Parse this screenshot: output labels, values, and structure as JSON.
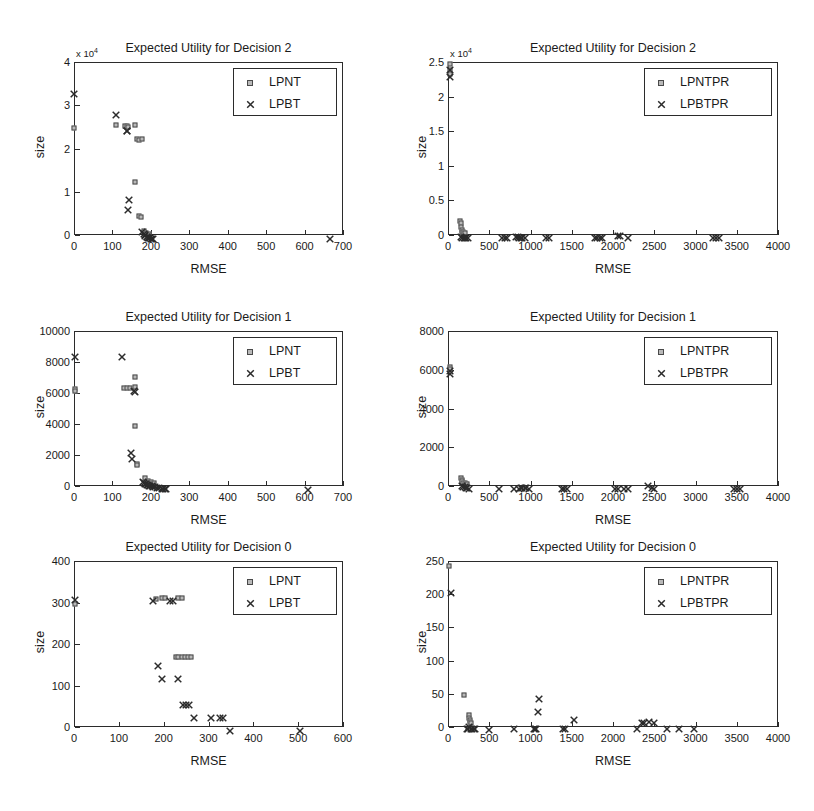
{
  "figure": {
    "width": 814,
    "height": 811,
    "background": "#ffffff",
    "ink_color": "#1a1a1a",
    "marker_square_fill": "#b9b9b9",
    "marker_square_edge": "#4a4a4a",
    "marker_x_color": "#2b2b2b"
  },
  "chart_data": [
    {
      "id": "panel-top-left",
      "type": "scatter",
      "title": "Expected Utility for Decision 2",
      "xlabel": "RMSE",
      "ylabel": "size",
      "xlim": [
        0,
        700
      ],
      "ylim": [
        0,
        40000
      ],
      "xticks": [
        0,
        100,
        200,
        300,
        400,
        500,
        600,
        700
      ],
      "yticks": [
        0,
        10000,
        20000,
        30000,
        40000
      ],
      "ytick_labels": [
        "0",
        "1",
        "2",
        "3",
        "4"
      ],
      "y_exponent_label": "x 10",
      "y_exponent_power": "4",
      "grid": false,
      "legend_position": "upper right",
      "series": [
        {
          "name": "LPNT",
          "marker": "square",
          "points": [
            [
              0,
              24800
            ],
            [
              108,
              25500
            ],
            [
              132,
              25300
            ],
            [
              138,
              25200
            ],
            [
              141,
              25000
            ],
            [
              160,
              25400
            ],
            [
              163,
              22100
            ],
            [
              170,
              22000
            ],
            [
              176,
              22100
            ],
            [
              158,
              12200
            ],
            [
              170,
              4300
            ],
            [
              175,
              4200
            ],
            [
              182,
              900
            ],
            [
              188,
              500
            ],
            [
              195,
              300
            ]
          ]
        },
        {
          "name": "LPBT",
          "marker": "x",
          "points": [
            [
              0,
              33700
            ],
            [
              110,
              28900
            ],
            [
              137,
              25300
            ],
            [
              139,
              25100
            ],
            [
              143,
              9200
            ],
            [
              140,
              6900
            ],
            [
              178,
              1800
            ],
            [
              181,
              1400
            ],
            [
              184,
              1100
            ],
            [
              186,
              900
            ],
            [
              189,
              700
            ],
            [
              191,
              600
            ],
            [
              193,
              500
            ],
            [
              195,
              400
            ],
            [
              198,
              350
            ],
            [
              200,
              300
            ],
            [
              203,
              250
            ],
            [
              206,
              200
            ],
            [
              665,
              120
            ]
          ]
        }
      ]
    },
    {
      "id": "panel-top-right",
      "type": "scatter",
      "title": "Expected Utility for Decision 2",
      "xlabel": "RMSE",
      "ylabel": "size",
      "xlim": [
        0,
        4000
      ],
      "ylim": [
        0,
        25000
      ],
      "xticks": [
        0,
        500,
        1000,
        1500,
        2000,
        2500,
        3000,
        3500,
        4000
      ],
      "yticks": [
        0,
        5000,
        10000,
        15000,
        20000,
        25000
      ],
      "ytick_labels": [
        "0",
        "0.5",
        "1",
        "1.5",
        "2",
        "2.5"
      ],
      "y_exponent_label": "x 10",
      "y_exponent_power": "4",
      "grid": false,
      "legend_position": "upper right",
      "series": [
        {
          "name": "LPNTPR",
          "marker": "square",
          "points": [
            [
              20,
              24700
            ],
            [
              25,
              23800
            ],
            [
              30,
              23300
            ],
            [
              150,
              2000
            ],
            [
              155,
              1700
            ],
            [
              160,
              1100
            ],
            [
              165,
              700
            ],
            [
              170,
              500
            ],
            [
              180,
              400
            ],
            [
              190,
              300
            ],
            [
              200,
              250
            ]
          ]
        },
        {
          "name": "LPBTPR",
          "marker": "x",
          "points": [
            [
              20,
              24600
            ],
            [
              28,
              23600
            ],
            [
              160,
              400
            ],
            [
              175,
              350
            ],
            [
              190,
              320
            ],
            [
              205,
              300
            ],
            [
              220,
              280
            ],
            [
              240,
              260
            ],
            [
              660,
              250
            ],
            [
              690,
              250
            ],
            [
              710,
              250
            ],
            [
              830,
              400
            ],
            [
              845,
              380
            ],
            [
              860,
              300
            ],
            [
              880,
              260
            ],
            [
              900,
              250
            ],
            [
              930,
              250
            ],
            [
              1190,
              260
            ],
            [
              1220,
              260
            ],
            [
              1780,
              260
            ],
            [
              1810,
              260
            ],
            [
              1840,
              260
            ],
            [
              1870,
              260
            ],
            [
              2060,
              600
            ],
            [
              2080,
              560
            ],
            [
              2180,
              250
            ],
            [
              3210,
              250
            ],
            [
              3250,
              250
            ],
            [
              3280,
              250
            ]
          ]
        }
      ]
    },
    {
      "id": "panel-mid-left",
      "type": "scatter",
      "title": "Expected Utility for Decision 1",
      "xlabel": "RMSE",
      "ylabel": "size",
      "xlim": [
        0,
        700
      ],
      "ylim": [
        0,
        10000
      ],
      "xticks": [
        0,
        100,
        200,
        300,
        400,
        500,
        600,
        700
      ],
      "yticks": [
        0,
        2000,
        4000,
        6000,
        8000,
        10000
      ],
      "ytick_labels": [
        "0",
        "2000",
        "4000",
        "6000",
        "8000",
        "10000"
      ],
      "grid": false,
      "legend_position": "upper right",
      "series": [
        {
          "name": "LPNT",
          "marker": "square",
          "points": [
            [
              2,
              6250
            ],
            [
              2,
              6150
            ],
            [
              131,
              6350
            ],
            [
              139,
              6330
            ],
            [
              145,
              6330
            ],
            [
              158,
              7050
            ],
            [
              160,
              6400
            ],
            [
              160,
              3880
            ],
            [
              163,
              1400
            ],
            [
              165,
              1330
            ],
            [
              185,
              500
            ],
            [
              193,
              350
            ],
            [
              200,
              250
            ],
            [
              208,
              180
            ]
          ]
        },
        {
          "name": "LPBT",
          "marker": "x",
          "points": [
            [
              2,
              8650
            ],
            [
              124,
              8640
            ],
            [
              155,
              6420
            ],
            [
              160,
              6400
            ],
            [
              149,
              2450
            ],
            [
              150,
              2050
            ],
            [
              180,
              600
            ],
            [
              183,
              520
            ],
            [
              186,
              470
            ],
            [
              188,
              430
            ],
            [
              190,
              400
            ],
            [
              193,
              380
            ],
            [
              196,
              350
            ],
            [
              199,
              330
            ],
            [
              202,
              300
            ],
            [
              205,
              280
            ],
            [
              210,
              250
            ],
            [
              215,
              220
            ],
            [
              222,
              190
            ],
            [
              228,
              160
            ],
            [
              232,
              140
            ],
            [
              236,
              120
            ],
            [
              240,
              100
            ],
            [
              610,
              60
            ]
          ]
        }
      ]
    },
    {
      "id": "panel-mid-right",
      "type": "scatter",
      "title": "Expected Utility for Decision 1",
      "xlabel": "RMSE",
      "ylabel": "size",
      "xlim": [
        0,
        4000
      ],
      "ylim": [
        0,
        8000
      ],
      "xticks": [
        0,
        500,
        1000,
        1500,
        2000,
        2500,
        3000,
        3500,
        4000
      ],
      "yticks": [
        0,
        2000,
        4000,
        6000,
        8000
      ],
      "ytick_labels": [
        "0",
        "2000",
        "4000",
        "6000",
        "8000"
      ],
      "grid": false,
      "legend_position": "upper right",
      "series": [
        {
          "name": "LPNTPR",
          "marker": "square",
          "points": [
            [
              20,
              6150
            ],
            [
              25,
              6050
            ],
            [
              155,
              420
            ],
            [
              165,
              330
            ],
            [
              175,
              240
            ],
            [
              185,
              180
            ],
            [
              200,
              140
            ],
            [
              215,
              110
            ],
            [
              230,
              90
            ]
          ]
        },
        {
          "name": "LPBTPR",
          "marker": "x",
          "points": [
            [
              20,
              6180
            ],
            [
              25,
              6020
            ],
            [
              170,
              260
            ],
            [
              185,
              230
            ],
            [
              200,
              200
            ],
            [
              215,
              180
            ],
            [
              235,
              150
            ],
            [
              260,
              120
            ],
            [
              620,
              90
            ],
            [
              800,
              110
            ],
            [
              860,
              100
            ],
            [
              880,
              130
            ],
            [
              900,
              150
            ],
            [
              930,
              160
            ],
            [
              950,
              130
            ],
            [
              980,
              110
            ],
            [
              1380,
              100
            ],
            [
              1410,
              100
            ],
            [
              1440,
              100
            ],
            [
              2030,
              110
            ],
            [
              2060,
              110
            ],
            [
              2130,
              110
            ],
            [
              2180,
              110
            ],
            [
              2420,
              280
            ],
            [
              2470,
              140
            ],
            [
              2500,
              110
            ],
            [
              3470,
              100
            ],
            [
              3500,
              100
            ],
            [
              3540,
              100
            ]
          ]
        }
      ]
    },
    {
      "id": "panel-bot-left",
      "type": "scatter",
      "title": "Expected Utility for Decision 0",
      "xlabel": "RMSE",
      "ylabel": "size",
      "xlim": [
        0,
        600
      ],
      "ylim": [
        0,
        400
      ],
      "xticks": [
        0,
        100,
        200,
        300,
        400,
        500,
        600
      ],
      "yticks": [
        0,
        100,
        200,
        300,
        400
      ],
      "ytick_labels": [
        "0",
        "100",
        "200",
        "300",
        "400"
      ],
      "grid": false,
      "legend_position": "upper right",
      "series": [
        {
          "name": "LPNT",
          "marker": "square",
          "points": [
            [
              2,
              297
            ],
            [
              183,
              308
            ],
            [
              196,
              310
            ],
            [
              203,
              310
            ],
            [
              232,
              310
            ],
            [
              240,
              310
            ],
            [
              227,
              168
            ],
            [
              233,
              168
            ],
            [
              241,
              168
            ],
            [
              248,
              168
            ],
            [
              255,
              168
            ],
            [
              262,
              168
            ]
          ]
        },
        {
          "name": "LPBT",
          "marker": "x",
          "points": [
            [
              2,
              318
            ],
            [
              176,
              316
            ],
            [
              215,
              316
            ],
            [
              220,
              315
            ],
            [
              187,
              158
            ],
            [
              196,
              127
            ],
            [
              233,
              127
            ],
            [
              243,
              66
            ],
            [
              249,
              66
            ],
            [
              256,
              66
            ],
            [
              268,
              33
            ],
            [
              305,
              33
            ],
            [
              325,
              33
            ],
            [
              333,
              33
            ],
            [
              348,
              3
            ],
            [
              503,
              3
            ]
          ]
        }
      ]
    },
    {
      "id": "panel-bot-right",
      "type": "scatter",
      "title": "Expected Utility for Decision 0",
      "xlabel": "RMSE",
      "ylabel": "size",
      "xlim": [
        0,
        4000
      ],
      "ylim": [
        0,
        250
      ],
      "xticks": [
        0,
        500,
        1000,
        1500,
        2000,
        2500,
        3000,
        3500,
        4000
      ],
      "yticks": [
        0,
        50,
        100,
        150,
        200,
        250
      ],
      "ytick_labels": [
        "0",
        "50",
        "100",
        "150",
        "200",
        "250"
      ],
      "grid": false,
      "legend_position": "upper right",
      "series": [
        {
          "name": "LPNTPR",
          "marker": "square",
          "points": [
            [
              15,
              242
            ],
            [
              190,
              48
            ],
            [
              250,
              18
            ],
            [
              255,
              14
            ],
            [
              262,
              11
            ],
            [
              270,
              8
            ],
            [
              280,
              6
            ]
          ]
        },
        {
          "name": "LPBTPR",
          "marker": "x",
          "points": [
            [
              40,
              210
            ],
            [
              225,
              5
            ],
            [
              245,
              5
            ],
            [
              260,
              7
            ],
            [
              275,
              5
            ],
            [
              290,
              5
            ],
            [
              310,
              4
            ],
            [
              330,
              4
            ],
            [
              500,
              3
            ],
            [
              805,
              5
            ],
            [
              1040,
              5
            ],
            [
              1055,
              5
            ],
            [
              1070,
              5
            ],
            [
              1085,
              30
            ],
            [
              1100,
              50
            ],
            [
              1390,
              5
            ],
            [
              1420,
              5
            ],
            [
              1530,
              18
            ],
            [
              2290,
              5
            ],
            [
              2350,
              13
            ],
            [
              2375,
              13
            ],
            [
              2440,
              15
            ],
            [
              2500,
              13
            ],
            [
              2660,
              5
            ],
            [
              2800,
              5
            ],
            [
              2980,
              5
            ]
          ]
        }
      ]
    }
  ]
}
